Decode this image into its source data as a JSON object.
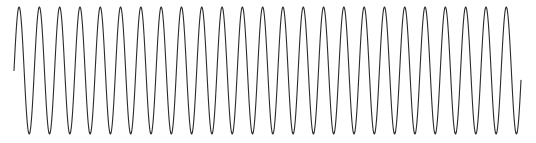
{
  "figure": {
    "name": "oscilloscope-sine-trace",
    "width": 536,
    "height": 143,
    "background_color": "#ffffff"
  },
  "chart_data": {
    "type": "line",
    "title": "",
    "subtitle": "",
    "xlabel": "",
    "ylabel": "",
    "grid": false,
    "legend_position": "none",
    "axes_visible": false,
    "tick_labels_x": [],
    "tick_labels_y": [],
    "annotations": [],
    "series": [
      {
        "name": "sine-wave",
        "waveform": "sine",
        "color": "#2b2b2b",
        "line_width": 1.1,
        "cycles": 25,
        "period_px": 20.3,
        "amplitude_px": 63.5,
        "centerline_y_px": 70.5,
        "peak_y_px": 7,
        "trough_y_px": 134,
        "x_start_px": 14,
        "x_end_px": 521,
        "y_start_px": 68,
        "y_end_px": 68,
        "phase_offset_rad": 0.0,
        "samples_per_cycle": 64
      }
    ],
    "xlim": [
      14,
      521
    ],
    "ylim": [
      7,
      134
    ]
  }
}
